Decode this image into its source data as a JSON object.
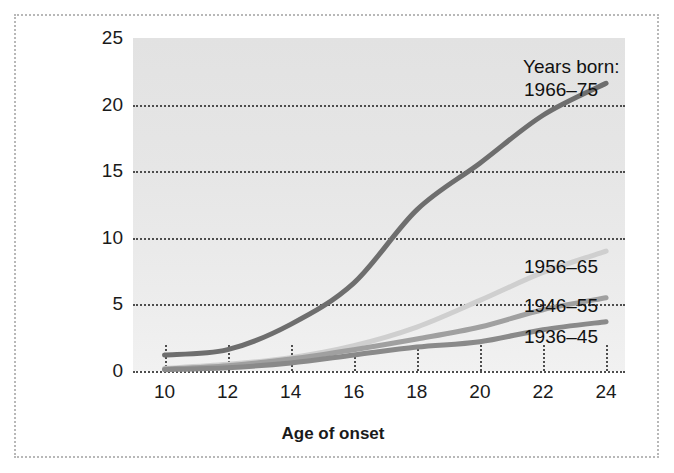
{
  "chart_data": {
    "type": "line",
    "title": "",
    "xlabel": "Age of onset",
    "ylabel": "Percent of Population",
    "xlim": [
      9,
      24.6
    ],
    "ylim": [
      0,
      25
    ],
    "xticks": [
      10,
      12,
      14,
      16,
      18,
      20,
      22,
      24
    ],
    "yticks": [
      0,
      5,
      10,
      15,
      20,
      25
    ],
    "grid": "dotted horizontal gridlines at y ticks, short dotted vertical ticks at x ticks",
    "legend_position": "right, inline labels at line ends",
    "legend_title": "Years born:",
    "x": [
      10,
      12,
      14,
      16,
      18,
      20,
      22,
      24
    ],
    "series": [
      {
        "name": "1966-75",
        "color": "#6e6e6e",
        "values": [
          1.2,
          1.6,
          3.5,
          6.6,
          12.1,
          15.6,
          19.2,
          21.6
        ],
        "label_x": 524,
        "label_y": 79
      },
      {
        "name": "1956-65",
        "color": "#cfcfcf",
        "values": [
          0.2,
          0.5,
          1.0,
          1.9,
          3.3,
          5.3,
          7.4,
          9.0
        ],
        "label_x": 524,
        "label_y": 256
      },
      {
        "name": "1946-55",
        "color": "#a0a0a0",
        "values": [
          0.15,
          0.4,
          0.9,
          1.6,
          2.4,
          3.3,
          4.6,
          5.5
        ],
        "label_x": 524,
        "label_y": 295
      },
      {
        "name": "1936-45",
        "color": "#8a8a8a",
        "values": [
          0.1,
          0.25,
          0.6,
          1.2,
          1.8,
          2.2,
          3.1,
          3.7
        ],
        "label_x": 524,
        "label_y": 326
      }
    ]
  },
  "axes": {
    "ylabel": "Percent of Population",
    "xlabel": "Age of onset",
    "yticks": [
      "0",
      "5",
      "10",
      "15",
      "20",
      "25"
    ],
    "xticks": [
      "10",
      "12",
      "14",
      "16",
      "18",
      "20",
      "22",
      "24"
    ]
  },
  "legend": {
    "title": "Years born:",
    "items": [
      "1966–75",
      "1956–65",
      "1946–55",
      "1936–45"
    ]
  }
}
